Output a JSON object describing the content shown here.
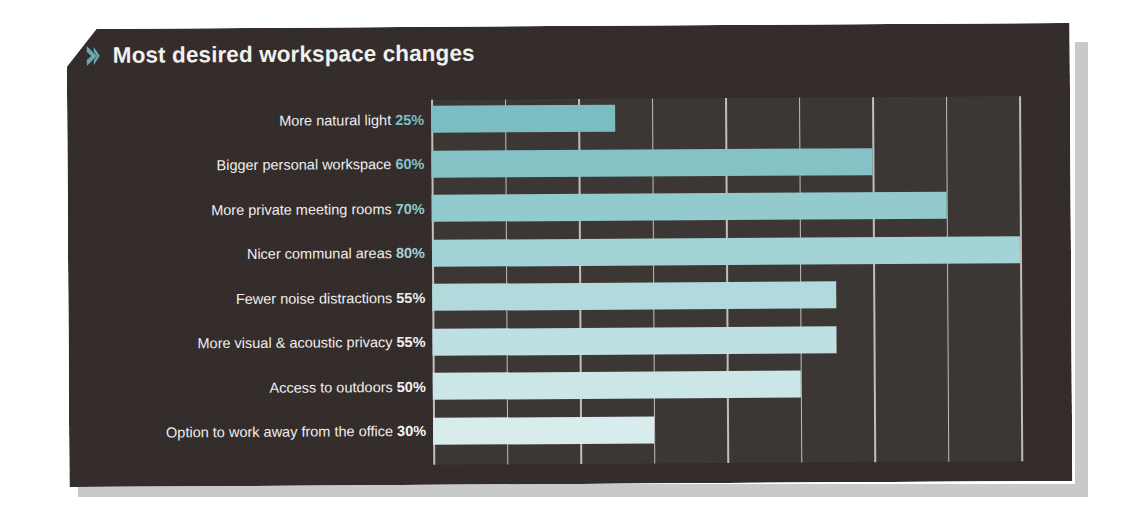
{
  "panel": {
    "title": "Most desired workspace changes",
    "chevron_icon": "chevron-right-icon",
    "background_color": "#332d2c",
    "plot_background_color": "#3c3735",
    "title_color": "#f2f0ee",
    "accent_color": "#79b6ba",
    "gridline_color": "#d9d7d2"
  },
  "chart_data": {
    "type": "bar",
    "orientation": "horizontal",
    "title": "Most desired workspace changes",
    "xlabel": "",
    "ylabel": "",
    "xlim": [
      0,
      80
    ],
    "grid": true,
    "gridline_step": 10,
    "legend": "none",
    "value_suffix": "%",
    "categories": [
      "More natural light",
      "Bigger personal workspace",
      "More private meeting rooms",
      "Nicer communal areas",
      "Fewer noise distractions",
      "More visual & acoustic privacy",
      "Access to outdoors",
      "Option to work away from the office"
    ],
    "values": [
      25,
      60,
      70,
      80,
      55,
      55,
      50,
      30
    ],
    "value_labels": [
      "25%",
      "60%",
      "70%",
      "80%",
      "55%",
      "55%",
      "50%",
      "30%"
    ],
    "bar_colors": [
      "#7cbdc2",
      "#85c2c6",
      "#92cace",
      "#a3d3d6",
      "#b2dadd",
      "#bfe0e2",
      "#cbe6e7",
      "#d8eced"
    ],
    "label_value_colors": [
      "#7cbdc2",
      "#85c2c6",
      "#92cace",
      "#a3d3d6",
      "#e8eced",
      "#eef1f2",
      "#f1f3f3",
      "#f4f5f5"
    ],
    "label_text_color": "#efeeec"
  },
  "rows": [
    {
      "label": "More natural light",
      "value": 25,
      "value_label": "25%"
    },
    {
      "label": "Bigger personal workspace",
      "value": 60,
      "value_label": "60%"
    },
    {
      "label": "More private meeting rooms",
      "value": 70,
      "value_label": "70%"
    },
    {
      "label": "Nicer communal areas",
      "value": 80,
      "value_label": "80%"
    },
    {
      "label": "Fewer noise distractions",
      "value": 55,
      "value_label": "55%"
    },
    {
      "label": "More visual & acoustic privacy",
      "value": 55,
      "value_label": "55%"
    },
    {
      "label": "Access to outdoors",
      "value": 50,
      "value_label": "50%"
    },
    {
      "label": "Option to work away from the office",
      "value": 30,
      "value_label": "30%"
    }
  ]
}
